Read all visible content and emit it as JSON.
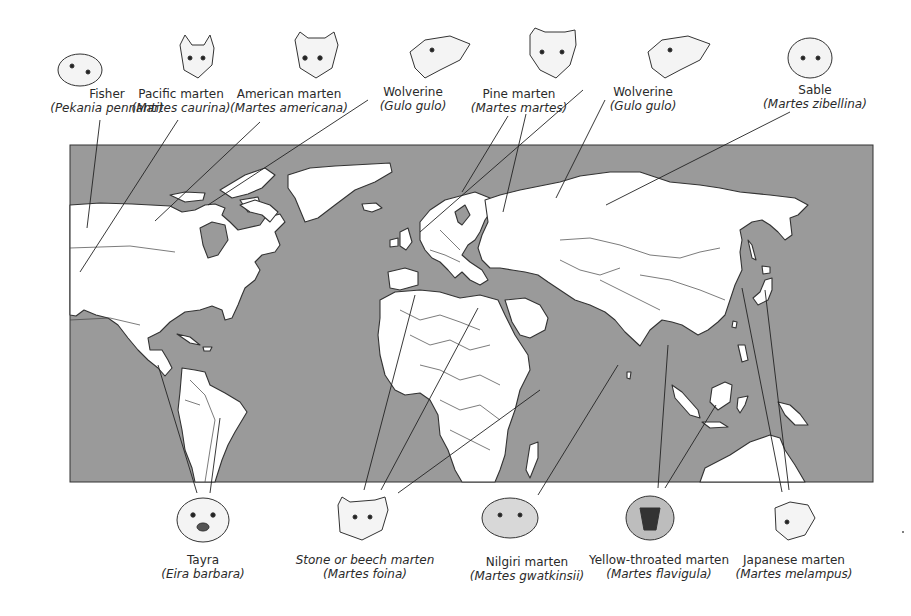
{
  "figure": {
    "map": {
      "frame": {
        "x": 70,
        "y": 145,
        "width": 803,
        "height": 337
      },
      "ocean_color": "#9a9a9a",
      "land_color": "#ffffff",
      "border_color": "#333333"
    },
    "top_labels": [
      {
        "common": "Fisher",
        "scientific": "(Pekania pennanti)",
        "x": 107,
        "y": 87,
        "head_x": 80
      },
      {
        "common": "Pacific marten",
        "scientific": "(Martes caurina)",
        "x": 181,
        "y": 87,
        "head_x": 196
      },
      {
        "common": "American marten",
        "scientific": "(Martes americana)",
        "x": 289,
        "y": 87,
        "head_x": 313
      },
      {
        "common": "Wolverine",
        "scientific": "(Gulo gulo)",
        "x": 413,
        "y": 85,
        "head_x": 430
      },
      {
        "common": "Pine marten",
        "scientific": "(Martes martes)",
        "x": 519,
        "y": 87,
        "head_x": 551
      },
      {
        "common": "Wolverine",
        "scientific": "(Gulo gulo)",
        "x": 643,
        "y": 85,
        "head_x": 667
      },
      {
        "common": "Sable",
        "scientific": "(Martes zibellina)",
        "x": 815,
        "y": 83,
        "head_x": 810
      }
    ],
    "bottom_labels": [
      {
        "common": "Tayra",
        "scientific": "(Eira barbara)",
        "x": 203,
        "y": 556,
        "head_x": 203,
        "italic_common": false
      },
      {
        "common": "Stone or beech marten",
        "scientific": "(Martes foina)",
        "x": 365,
        "y": 556,
        "head_x": 360,
        "italic_common": true
      },
      {
        "common": "Nilgiri marten",
        "scientific": "(Martes gwatkinsii)",
        "x": 527,
        "y": 558,
        "head_x": 510,
        "italic_common": false
      },
      {
        "common": "Yellow-throated marten",
        "scientific": "(Martes flavigula)",
        "x": 659,
        "y": 556,
        "head_x": 650,
        "italic_common": false
      },
      {
        "common": "Japanese marten",
        "scientific": "(Martes melampus)",
        "x": 794,
        "y": 556,
        "head_x": 793,
        "italic_common": false
      }
    ]
  }
}
